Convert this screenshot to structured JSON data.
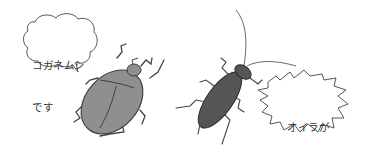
{
  "illustration": {
    "beetle": {
      "name": "chafer beetle (kogane-mushi)",
      "body_color": "#8f8f8f",
      "bubble": {
        "shape": "cloud",
        "line1": "コガネムシ",
        "line2": "です"
      }
    },
    "cockroach": {
      "name": "cockroach",
      "body_color": "#555555",
      "bubble": {
        "shape": "spiky",
        "line1": "オイラが",
        "line2": "コガネムシ!"
      }
    },
    "colors": {
      "background": "#ffffff",
      "ink": "#3a3a3a"
    }
  }
}
